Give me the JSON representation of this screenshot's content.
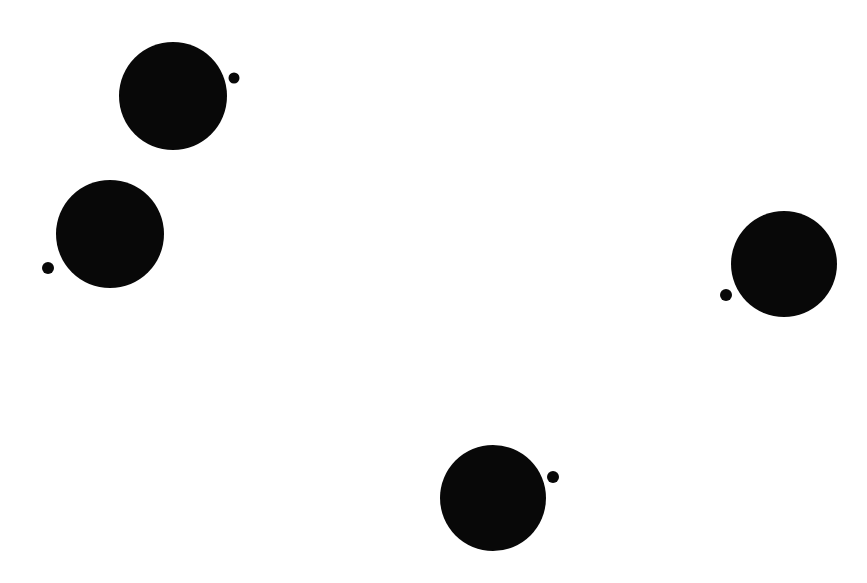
{
  "page": {
    "width": 867,
    "height": 583,
    "background_color": "#ffffff"
  },
  "figure": {
    "title": "",
    "shape_color": "#080808",
    "shape_count": 8,
    "group_count": 4
  },
  "chart_data": {
    "type": "scatter",
    "title": "",
    "xlabel": "",
    "ylabel": "",
    "xlim": [
      0,
      867
    ],
    "ylim": [
      0,
      583
    ],
    "grid": false,
    "legend": null,
    "units": "pixels",
    "marker_color": "#080808",
    "background": "#ffffff",
    "series": [
      {
        "name": "large-circles",
        "radius": 54,
        "points": [
          {
            "label": "large-circle-top-left",
            "x": 173,
            "y": 96,
            "r": 54
          },
          {
            "label": "large-circle-left",
            "x": 110,
            "y": 234,
            "r": 54
          },
          {
            "label": "large-circle-right",
            "x": 784,
            "y": 264,
            "r": 53
          },
          {
            "label": "large-circle-bottom",
            "x": 493,
            "y": 498,
            "r": 53
          }
        ]
      },
      {
        "name": "satellite-dots",
        "radius": 6,
        "points": [
          {
            "label": "satellite-dot-top-left",
            "x": 234,
            "y": 78,
            "r": 5.5
          },
          {
            "label": "satellite-dot-left",
            "x": 48,
            "y": 268,
            "r": 6
          },
          {
            "label": "satellite-dot-right",
            "x": 726,
            "y": 295,
            "r": 6
          },
          {
            "label": "satellite-dot-bottom",
            "x": 553,
            "y": 477,
            "r": 6
          }
        ]
      }
    ]
  }
}
